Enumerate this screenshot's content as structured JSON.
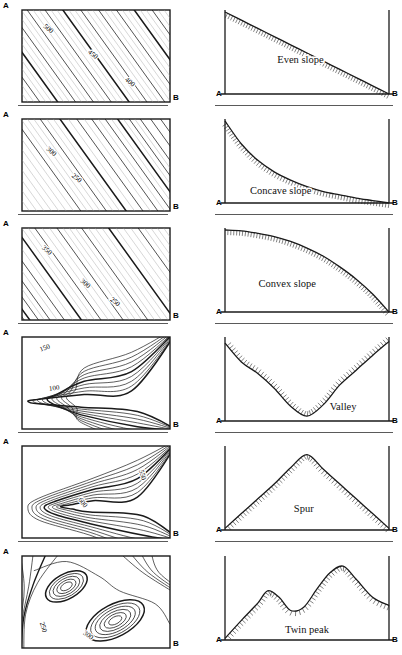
{
  "figure": {
    "columns": [
      "contour map",
      "cross-section profile"
    ],
    "endpoint_labels": {
      "start": "A",
      "end": "B"
    }
  },
  "chart_data": {
    "type": "line",
    "xlabel": "Distance from A to B",
    "ylabel": "Elevation",
    "grid": false,
    "legend": null,
    "panels": [
      {
        "name": "even-slope",
        "label": "Even slope",
        "map": {
          "pattern": "evenly spaced parallel contours running NE-SW",
          "shading": "uniform diagonal hatching",
          "contour_labels": [
            "500",
            "450",
            "400"
          ],
          "contour_count": 13,
          "spacing": "even"
        },
        "profile": {
          "x": [
            0,
            10,
            20,
            30,
            40,
            50,
            60,
            70,
            80,
            90,
            100
          ],
          "y": [
            100,
            90,
            80,
            70,
            60,
            50,
            40,
            30,
            20,
            10,
            0
          ],
          "shape": "straight descending line",
          "hatch_side": "below"
        }
      },
      {
        "name": "concave-slope",
        "label": "Concave slope",
        "map": {
          "pattern": "parallel contours, closely spaced at A (top-left), widening toward B",
          "shading": "diagonal hatching, denser top-left",
          "contour_labels": [
            "300",
            "250"
          ],
          "contour_count": 12,
          "spacing": "close at A, wide at B"
        },
        "profile": {
          "x": [
            0,
            10,
            20,
            30,
            40,
            50,
            60,
            70,
            80,
            90,
            100
          ],
          "y": [
            100,
            72,
            52,
            38,
            28,
            20,
            14,
            10,
            6,
            3,
            0
          ],
          "shape": "steep near A then flattening toward B",
          "hatch_side": "below"
        }
      },
      {
        "name": "convex-slope",
        "label": "Convex slope",
        "map": {
          "pattern": "parallel contours, widely spaced at A, crowding toward B (bottom-right)",
          "shading": "diagonal hatching, denser bottom-right",
          "contour_labels": [
            "350",
            "300",
            "250"
          ],
          "contour_count": 13,
          "spacing": "wide at A, close at B"
        },
        "profile": {
          "x": [
            0,
            10,
            20,
            30,
            40,
            50,
            60,
            70,
            80,
            90,
            100
          ],
          "y": [
            100,
            99,
            96,
            92,
            86,
            78,
            68,
            55,
            40,
            22,
            0
          ],
          "shape": "gentle near A then steepening toward B",
          "hatch_side": "below"
        }
      },
      {
        "name": "valley",
        "label": "Valley",
        "map": {
          "pattern": "V-shaped contours pointing upslope toward the left, nested",
          "shading": "none",
          "contour_labels": [
            "150",
            "100"
          ],
          "contour_count": 9,
          "spacing": "nested V opening to the right"
        },
        "profile": {
          "x": [
            0,
            10,
            20,
            30,
            40,
            50,
            60,
            70,
            80,
            90,
            100
          ],
          "y": [
            95,
            72,
            58,
            40,
            18,
            6,
            20,
            44,
            62,
            80,
            97
          ],
          "shape": "V-shaped trough, low point near centre",
          "hatch_side": "above"
        }
      },
      {
        "name": "spur",
        "label": "Spur",
        "map": {
          "pattern": "rounded contours projecting outward, nested tongue shape",
          "shading": "none",
          "contour_labels": [
            "550",
            "600"
          ],
          "contour_count": 10,
          "spacing": "nested tongue opening to the left"
        },
        "profile": {
          "x": [
            0,
            10,
            20,
            30,
            40,
            50,
            60,
            70,
            80,
            90,
            100
          ],
          "y": [
            2,
            20,
            38,
            56,
            76,
            92,
            74,
            56,
            38,
            20,
            2
          ],
          "shape": "single rounded peak near centre",
          "hatch_side": "below"
        }
      },
      {
        "name": "twin-peak",
        "label": "Twin peak",
        "map": {
          "pattern": "two separate sets of concentric closed contours",
          "shading": "none",
          "contour_labels": [
            "250",
            "300"
          ],
          "contour_count": 14,
          "spacing": "two concentric oval groups, upper-left and lower-right"
        },
        "profile": {
          "x": [
            0,
            10,
            20,
            26,
            33,
            40,
            48,
            56,
            64,
            72,
            80,
            90,
            100
          ],
          "y": [
            2,
            24,
            45,
            60,
            52,
            36,
            40,
            62,
            82,
            90,
            74,
            52,
            42
          ],
          "shape": "two summits, the right summit higher",
          "hatch_side": "below"
        }
      }
    ]
  }
}
